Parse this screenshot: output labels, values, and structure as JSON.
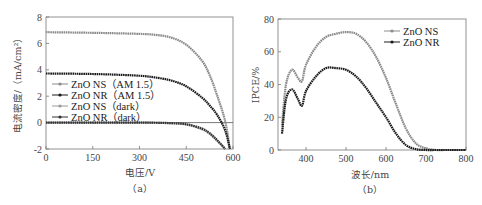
{
  "chart_data": [
    {
      "panel": "(a)",
      "type": "line",
      "title": "",
      "xlabel": "电压/V",
      "ylabel": "电流密度/(mA/cm²)",
      "xlim": [
        0,
        600
      ],
      "ylim": [
        -2,
        8
      ],
      "xticks": [
        0,
        150,
        300,
        450,
        600
      ],
      "yticks": [
        -2,
        0,
        2,
        4,
        6,
        8
      ],
      "grid": false,
      "legend_position": "center-left",
      "x": [
        0,
        100,
        200,
        300,
        350,
        400,
        450,
        500,
        525,
        550,
        575,
        590
      ],
      "series": [
        {
          "name": "ZnO NS (AM 1.5)",
          "color": "#8a8a8a",
          "marker": "circle",
          "values": [
            6.85,
            6.82,
            6.78,
            6.72,
            6.65,
            6.45,
            5.9,
            4.7,
            3.6,
            2.0,
            0.1,
            -2.0
          ]
        },
        {
          "name": "ZnO NR (AM 1.5)",
          "color": "#1a1a1a",
          "marker": "square",
          "values": [
            3.72,
            3.7,
            3.65,
            3.55,
            3.42,
            3.2,
            2.75,
            1.9,
            1.3,
            0.55,
            -0.6,
            -2.0
          ]
        },
        {
          "name": "ZnO NS (dark)",
          "color": "#9a9a9a",
          "marker": "triangle",
          "values": [
            0.0,
            0.0,
            0.0,
            0.0,
            -0.02,
            -0.05,
            -0.15,
            -0.5,
            -0.85,
            -1.4,
            -2.0,
            null
          ]
        },
        {
          "name": "ZnO NR (dark)",
          "color": "#333333",
          "marker": "star",
          "values": [
            0.0,
            0.0,
            0.0,
            0.0,
            -0.01,
            -0.04,
            -0.12,
            -0.45,
            -0.8,
            -1.35,
            -2.0,
            null
          ]
        }
      ],
      "reference_line_y": 0,
      "caption": "(a)"
    },
    {
      "panel": "(b)",
      "type": "line",
      "title": "",
      "xlabel": "波长/nm",
      "ylabel": "IPCE/%",
      "xlim": [
        330,
        800
      ],
      "ylim": [
        0,
        80
      ],
      "xticks": [
        400,
        500,
        600,
        700,
        800
      ],
      "yticks": [
        0,
        20,
        40,
        60,
        80
      ],
      "grid": false,
      "legend_position": "upper-right",
      "x": [
        340,
        350,
        365,
        380,
        390,
        400,
        425,
        450,
        475,
        500,
        525,
        550,
        575,
        600,
        625,
        650,
        675,
        700,
        725,
        750,
        800
      ],
      "series": [
        {
          "name": "ZnO NS",
          "color": "#8a8a8a",
          "marker": "circle",
          "values": [
            15,
            40,
            49,
            44,
            42,
            52,
            63,
            69,
            71,
            72,
            71,
            66,
            57,
            44,
            28,
            13,
            4,
            1,
            0,
            0,
            0
          ]
        },
        {
          "name": "ZnO NR",
          "color": "#1a1a1a",
          "marker": "square",
          "values": [
            10,
            31,
            37,
            31,
            27,
            36,
            45,
            50,
            50,
            49,
            45,
            38,
            29,
            20,
            10,
            3,
            0.5,
            0,
            0,
            0,
            0
          ]
        }
      ],
      "caption": "(b)"
    }
  ],
  "panels": {
    "a": {
      "caption": "（a）",
      "xlabel": "电压/V",
      "ylabel": "电流密度/（mA/cm²）",
      "xticks": [
        "0",
        "150",
        "300",
        "450",
        "600"
      ],
      "yticks": [
        "-2",
        "0",
        "2",
        "4",
        "6",
        "8"
      ],
      "legend": [
        "ZnO NS（AM 1.5）",
        "ZnO NR（AM 1.5）",
        "ZnO NS（dark）",
        "ZnO NR（dark）"
      ]
    },
    "b": {
      "caption": "（b）",
      "xlabel": "波长/nm",
      "ylabel": "IPCE/%",
      "xticks": [
        "400",
        "500",
        "600",
        "700",
        "800"
      ],
      "yticks": [
        "0",
        "20",
        "40",
        "60",
        "80"
      ],
      "legend": [
        "ZnO NS",
        "ZnO NR"
      ]
    }
  }
}
